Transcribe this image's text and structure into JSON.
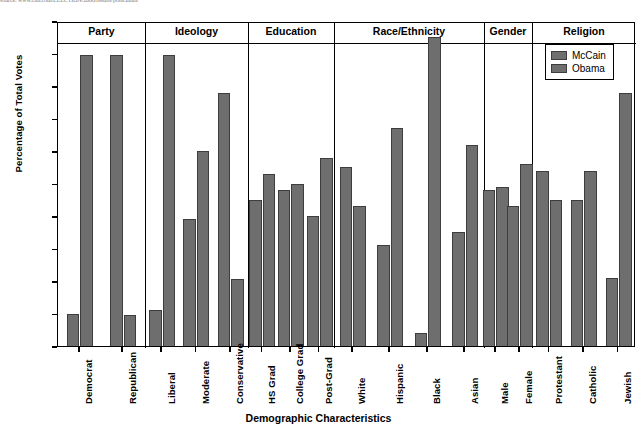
{
  "source_line": "source: www.cnn.com/ELECTION/2008/results/polls.main/",
  "chart_data": {
    "type": "bar",
    "title": "",
    "xlabel": "Demographic Characteristics",
    "ylabel": "Percentage of Total Votes",
    "ylim": [
      0,
      100
    ],
    "ytick_step": 10,
    "yticks": [
      100,
      90,
      80,
      70,
      60,
      50,
      40,
      30,
      20,
      10,
      0
    ],
    "grid": false,
    "legend_position": "top-right",
    "categories": [
      "Democrat",
      "Republican",
      "Liberal",
      "Moderate",
      "Conservative",
      "HS Grad",
      "College Grad",
      "Post-Grad",
      "White",
      "Hispanic",
      "Black",
      "Asian",
      "Male",
      "Female",
      "Protestant",
      "Catholic",
      "Jewish"
    ],
    "series": [
      {
        "name": "McCain",
        "color": "#6e6e6e",
        "values": [
          10,
          89.5,
          11,
          39,
          78,
          45,
          48,
          40,
          55,
          31,
          4,
          35,
          48,
          43,
          54,
          45,
          21
        ]
      },
      {
        "name": "Obama",
        "color": "#6e6e6e",
        "values": [
          89.5,
          9.5,
          89.5,
          60,
          20.5,
          53,
          50,
          58,
          43,
          67,
          95,
          62,
          49,
          56,
          45,
          54,
          78
        ]
      }
    ],
    "groups": [
      {
        "label": "Party",
        "categories": [
          "Democrat",
          "Republican"
        ]
      },
      {
        "label": "Ideology",
        "categories": [
          "Liberal",
          "Moderate",
          "Conservative"
        ]
      },
      {
        "label": "Education",
        "categories": [
          "HS Grad",
          "College Grad",
          "Post-Grad"
        ]
      },
      {
        "label": "Race/Ethnicity",
        "categories": [
          "White",
          "Hispanic",
          "Black",
          "Asian"
        ]
      },
      {
        "label": "Gender",
        "categories": [
          "Male",
          "Female"
        ]
      },
      {
        "label": "Religion",
        "categories": [
          "Protestant",
          "Catholic",
          "Jewish"
        ]
      }
    ]
  },
  "legend": {
    "items": [
      {
        "label": "McCain"
      },
      {
        "label": "Obama"
      }
    ]
  }
}
